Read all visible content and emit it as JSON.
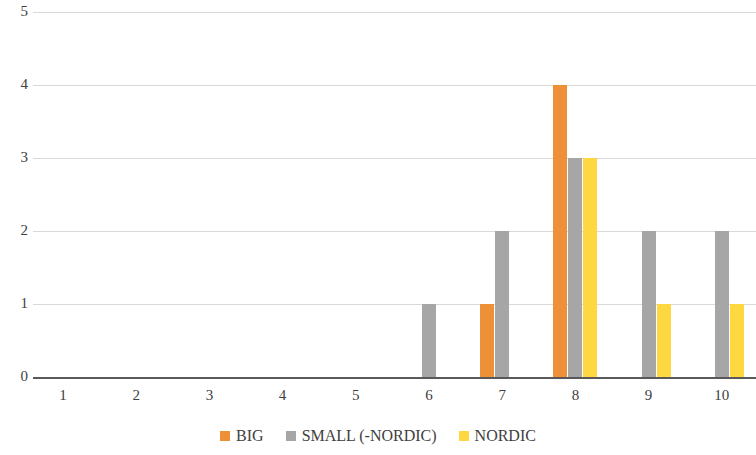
{
  "chart_data": {
    "type": "bar",
    "title": "",
    "subtitle": "",
    "xlabel": "",
    "ylabel": "",
    "categories": [
      "1",
      "2",
      "3",
      "4",
      "5",
      "6",
      "7",
      "8",
      "9",
      "10"
    ],
    "series": [
      {
        "name": "BIG",
        "color": "#ED9037",
        "values": [
          0,
          0,
          0,
          0,
          0,
          0,
          1,
          4,
          0,
          0
        ]
      },
      {
        "name": "SMALL (-NORDIC)",
        "color": "#A6A6A6",
        "values": [
          0,
          0,
          0,
          0,
          0,
          1,
          2,
          3,
          2,
          2
        ]
      },
      {
        "name": "NORDIC",
        "color": "#FFD740",
        "values": [
          0,
          0,
          0,
          0,
          0,
          0,
          0,
          3,
          1,
          1
        ]
      }
    ],
    "ylim": [
      0,
      5
    ],
    "y_ticks": [
      "0",
      "1",
      "2",
      "3",
      "4",
      "5"
    ],
    "grid": true,
    "grid_axis": "y",
    "legend_position": "bottom",
    "axis_color": "#595959",
    "gridline_color": "#D9D9D9"
  }
}
